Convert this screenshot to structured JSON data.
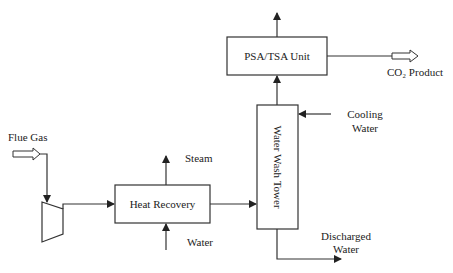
{
  "diagram": {
    "title_partial": "",
    "units": {
      "psa_tsa": {
        "label": "PSA/TSA Unit"
      },
      "heat_recovery": {
        "label": "Heat Recovery"
      },
      "water_wash_tower": {
        "label": "Water Wash Tower"
      },
      "compressor": {
        "label": ""
      }
    },
    "streams": {
      "flue_gas": "Flue Gas",
      "steam": "Steam",
      "water_in": "Water",
      "cooling_water_line1": "Cooling",
      "cooling_water_line2": "Water",
      "discharged_water_line1": "Discharged",
      "discharged_water_line2": "Water",
      "co2_product": "CO₂ Product"
    },
    "colors": {
      "line": "#333333",
      "background": "#ffffff"
    }
  }
}
